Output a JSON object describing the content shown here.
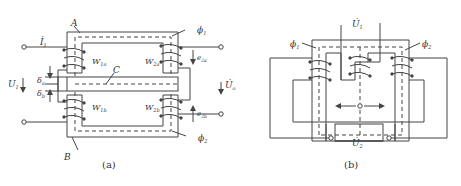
{
  "figure_a": {
    "caption": "(a)",
    "labels": {
      "core_top": "A",
      "core_bottom": "B",
      "bar": "C",
      "current_in": "İ",
      "current_in_sub": "1",
      "voltage_in": "U",
      "voltage_in_sub": "1",
      "voltage_out": "U̇",
      "voltage_out_sub": "o",
      "flux_top": "ϕ",
      "flux_top_sub": "1",
      "flux_bottom": "ϕ",
      "flux_bottom_sub": "2",
      "gap_a": "δ",
      "gap_a_sub": "a",
      "gap_b": "δ",
      "gap_b_sub": "b",
      "w1a": "W",
      "w1a_sub": "1a",
      "w2a": "W",
      "w2a_sub": "2a",
      "w1b": "W",
      "w1b_sub": "1b",
      "w2b": "W",
      "w2b_sub": "2b",
      "e2a": "e",
      "e2a_sub": "2a",
      "e2b": "e",
      "e2b_sub": "2b"
    }
  },
  "figure_b": {
    "caption": "(b)",
    "labels": {
      "voltage_top": "U̇",
      "voltage_top_sub": "1",
      "voltage_bottom": "U̇",
      "voltage_bottom_sub": "2",
      "flux_left": "ϕ",
      "flux_left_sub": "1",
      "flux_right": "ϕ",
      "flux_right_sub": "2"
    }
  },
  "colors": {
    "line": "#444444",
    "background": "#ffffff"
  }
}
